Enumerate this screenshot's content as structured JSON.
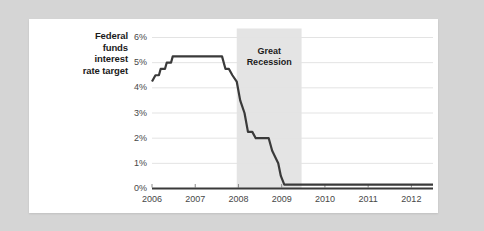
{
  "chart_data": {
    "type": "line",
    "title": "",
    "subtitle": "",
    "ylabel_lines": [
      "Federal",
      "funds",
      "interest",
      "rate target"
    ],
    "ylabel": "Federal funds interest rate target",
    "xlabel": "",
    "ylim": [
      0,
      6
    ],
    "xlim": [
      2006.0,
      2012.5
    ],
    "grid": true,
    "legend": "none",
    "y_ticks": [
      0,
      1,
      2,
      3,
      4,
      5,
      6
    ],
    "y_tick_labels": [
      "0%",
      "1%",
      "2%",
      "3%",
      "4%",
      "5%",
      "6%"
    ],
    "x_ticks": [
      2006,
      2007,
      2008,
      2009,
      2010,
      2011,
      2012
    ],
    "x_tick_labels": [
      "2006",
      "2007",
      "2008",
      "2009",
      "2010",
      "2011",
      "2012"
    ],
    "annotations": [
      {
        "name": "great-recession-band",
        "lines": [
          "Great",
          "Recession"
        ],
        "text": "Great Recession",
        "x_start": 2007.96,
        "x_end": 2009.46,
        "shade_color": "#e4e4e4"
      }
    ],
    "series": [
      {
        "name": "Federal funds interest rate target",
        "color": "#3a3a3a",
        "line_width": 2.2,
        "step": true,
        "x": [
          2006.0,
          2006.08,
          2006.16,
          2006.2,
          2006.3,
          2006.34,
          2006.44,
          2006.48,
          2007.62,
          2007.7,
          2007.78,
          2007.86,
          2007.96,
          2008.04,
          2008.14,
          2008.22,
          2008.32,
          2008.4,
          2008.46,
          2008.7,
          2008.78,
          2008.92,
          2008.98,
          2009.06,
          2012.5
        ],
        "y": [
          4.25,
          4.5,
          4.5,
          4.75,
          4.75,
          5.0,
          5.0,
          5.25,
          5.25,
          4.75,
          4.75,
          4.5,
          4.25,
          3.5,
          3.0,
          2.25,
          2.25,
          2.0,
          2.0,
          2.0,
          1.5,
          1.0,
          0.5,
          0.15,
          0.15
        ]
      }
    ]
  },
  "colors": {
    "page_background": "#d5d5d5",
    "card_background": "#ffffff",
    "line": "#3a3a3a",
    "gridline": "#e3e3e3",
    "axis": "#3a3a3a",
    "recession_shade": "#e4e4e4",
    "tick_text": "#474747",
    "label_text": "#1b1b1b"
  }
}
